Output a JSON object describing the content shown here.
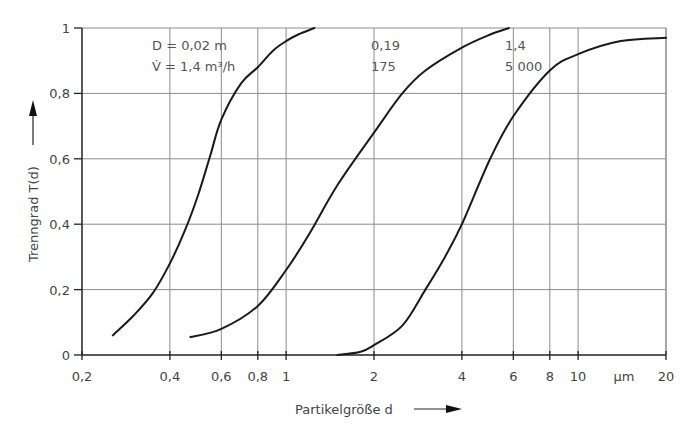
{
  "chart_data": {
    "type": "line",
    "title": "",
    "xlabel": "Partikelgröße d",
    "ylabel": "Trenngrad T(d)",
    "x_unit": "µm",
    "x_scale": "log",
    "xlim": [
      0.2,
      20
    ],
    "ylim": [
      0,
      1
    ],
    "grid": true,
    "legend": "none (inline annotations)",
    "x_ticks": [
      {
        "value": 0.2,
        "label": "0,2"
      },
      {
        "value": 0.4,
        "label": "0,4"
      },
      {
        "value": 0.6,
        "label": "0,6"
      },
      {
        "value": 0.8,
        "label": "0,8"
      },
      {
        "value": 1,
        "label": "1"
      },
      {
        "value": 2,
        "label": "2"
      },
      {
        "value": 4,
        "label": "4"
      },
      {
        "value": 6,
        "label": "6"
      },
      {
        "value": 8,
        "label": "8"
      },
      {
        "value": 10,
        "label": "10"
      },
      {
        "value": 20,
        "label": "20"
      }
    ],
    "y_ticks": [
      {
        "value": 0,
        "label": "0"
      },
      {
        "value": 0.2,
        "label": "0,2"
      },
      {
        "value": 0.4,
        "label": "0,4"
      },
      {
        "value": 0.6,
        "label": "0,6"
      },
      {
        "value": 0.8,
        "label": "0,8"
      },
      {
        "value": 1,
        "label": "1"
      }
    ],
    "series": [
      {
        "name": "D = 0,02 m; V̇ = 1,4 m³/h",
        "annotation": [
          "D = 0,02 m",
          "V̇ = 1,4 m³/h"
        ],
        "x": [
          0.255,
          0.3,
          0.35,
          0.4,
          0.45,
          0.5,
          0.55,
          0.6,
          0.7,
          0.8,
          0.9,
          1.0,
          1.1,
          1.25
        ],
        "y": [
          0.06,
          0.12,
          0.19,
          0.28,
          0.38,
          0.49,
          0.61,
          0.72,
          0.83,
          0.88,
          0.93,
          0.96,
          0.98,
          1.0
        ]
      },
      {
        "name": "D = 0,19 m; V̇ = 175 m³/h",
        "annotation": [
          "0,19",
          "175"
        ],
        "x": [
          0.47,
          0.6,
          0.8,
          1.0,
          1.2,
          1.5,
          2.0,
          2.5,
          3.0,
          4.0,
          5.0,
          5.8
        ],
        "y": [
          0.055,
          0.08,
          0.15,
          0.26,
          0.37,
          0.52,
          0.68,
          0.8,
          0.87,
          0.94,
          0.98,
          1.0
        ]
      },
      {
        "name": "D = 1,4 m; V̇ = 5 000 m³/h",
        "annotation": [
          "1,4",
          "5 000"
        ],
        "x": [
          1.5,
          1.8,
          2.0,
          2.5,
          3.0,
          3.5,
          4.0,
          5.0,
          6.0,
          8.0,
          10.0,
          14.0,
          20.0
        ],
        "y": [
          0.0,
          0.01,
          0.03,
          0.09,
          0.2,
          0.3,
          0.4,
          0.6,
          0.73,
          0.87,
          0.92,
          0.96,
          0.97
        ]
      }
    ]
  },
  "axes": {
    "x_title": "Partikelgröße d",
    "y_title": "Trenngrad T(d)",
    "x_unit": "µm"
  },
  "colors": {
    "curve": "#1a1a1a",
    "grid": "#8c8c8c",
    "axis": "#222222",
    "text": "#444444"
  }
}
